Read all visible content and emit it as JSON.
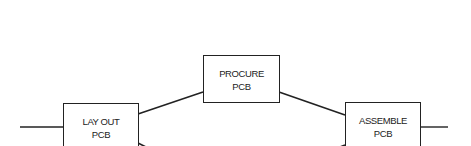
{
  "diagram": {
    "type": "flow / activity network",
    "nodes": [
      {
        "id": "layout",
        "line1": "LAY OUT",
        "line2": "PCB"
      },
      {
        "id": "procure",
        "line1": "PROCURE",
        "line2": "PCB"
      },
      {
        "id": "assemble",
        "line1": "ASSEMBLE",
        "line2": "PCB"
      }
    ],
    "edges": [
      {
        "from": "start",
        "to": "layout"
      },
      {
        "from": "layout",
        "to": "procure"
      },
      {
        "from": "procure",
        "to": "assemble"
      },
      {
        "from": "layout",
        "to": "(continues below, cropped)"
      },
      {
        "from": "(continues below, cropped)",
        "to": "assemble"
      },
      {
        "from": "assemble",
        "to": "end"
      }
    ],
    "colors": {
      "stroke": "#222222",
      "background": "#ffffff"
    }
  }
}
